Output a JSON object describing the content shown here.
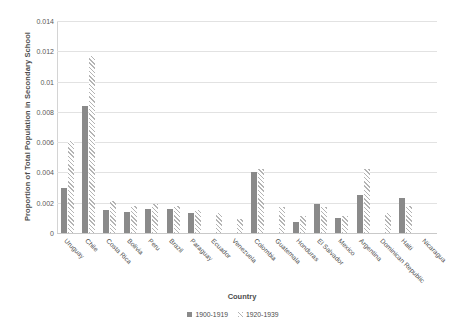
{
  "chart_data": {
    "type": "bar",
    "title": "",
    "xlabel": "Country",
    "ylabel": "Proportion of Total Population in Secondary School",
    "ylim": [
      0,
      0.014
    ],
    "yticks": [
      0,
      0.002,
      0.004,
      0.006,
      0.008,
      0.01,
      0.012,
      0.014
    ],
    "ytick_labels": [
      "0",
      "0.002",
      "0.004",
      "0.006",
      "0.008",
      "0.01",
      "0.012",
      "0.014"
    ],
    "grid": true,
    "legend_position": "bottom",
    "categories": [
      "Uruguay",
      "Chile",
      "Costa Rica",
      "Bolivia",
      "Peru",
      "Brazil",
      "Paraguay",
      "Ecuador",
      "Venezuela",
      "Colombia",
      "Guatemala",
      "Honduras",
      "El Salvador",
      "Mexico",
      "Argentina",
      "Dominican Republic",
      "Haiti",
      "Nicaragua"
    ],
    "series": [
      {
        "name": "1900-1919",
        "color": "#8a8a8a",
        "pattern": "solid",
        "values": [
          0.003,
          0.0084,
          0.0015,
          0.0014,
          0.0016,
          0.0016,
          0.0013,
          0.0,
          0.0,
          0.004,
          0.0,
          0.0007,
          0.0019,
          0.001,
          0.0025,
          0.0,
          0.0023,
          0.0
        ]
      },
      {
        "name": "1920-1939",
        "color": "#b4b4b4",
        "pattern": "hatched",
        "values": [
          0.0061,
          0.0117,
          0.0021,
          0.0018,
          0.0019,
          0.0018,
          0.0015,
          0.0013,
          0.0009,
          0.0042,
          0.0017,
          0.0011,
          0.0017,
          0.0011,
          0.0042,
          0.0013,
          0.0018,
          0.0
        ]
      }
    ]
  },
  "legend": {
    "items": [
      {
        "label": "1900-1919",
        "pattern": "solid"
      },
      {
        "label": "1920-1939",
        "pattern": "hatch"
      }
    ]
  }
}
